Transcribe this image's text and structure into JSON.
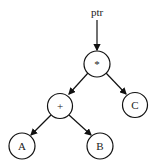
{
  "diagram": {
    "type": "expression-tree",
    "pointer_label": "ptr",
    "nodes": [
      {
        "id": "root",
        "label": "*",
        "cx": 97,
        "cy": 64
      },
      {
        "id": "plus",
        "label": "+",
        "cx": 60,
        "cy": 106
      },
      {
        "id": "c",
        "label": "C",
        "cx": 135,
        "cy": 105
      },
      {
        "id": "a",
        "label": "A",
        "cx": 22,
        "cy": 146
      },
      {
        "id": "b",
        "label": "B",
        "cx": 100,
        "cy": 146
      }
    ],
    "edges": [
      {
        "from": "ptr",
        "to": "root"
      },
      {
        "from": "root",
        "to": "plus"
      },
      {
        "from": "root",
        "to": "c"
      },
      {
        "from": "plus",
        "to": "a"
      },
      {
        "from": "plus",
        "to": "b"
      }
    ],
    "colors": {
      "stroke": "#111111",
      "background": "#ffffff"
    }
  }
}
